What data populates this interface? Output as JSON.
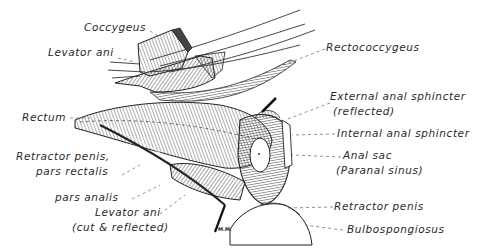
{
  "figure": {
    "signature": "M.M.",
    "labels": {
      "coccygeus": "Coccygeus",
      "levator_ani_top": "Levator ani",
      "rectum": "Rectum",
      "retractor_penis_rectalis_1": "Retractor penis,",
      "retractor_penis_rectalis_2": "pars rectalis",
      "pars_analis": "pars analis",
      "levator_ani_cut_1": "Levator ani",
      "levator_ani_cut_2": "(cut & reflected)",
      "rectococcygeus": "Rectococcygeus",
      "external_sphincter_1": "External anal sphincter",
      "external_sphincter_2": "(reflected)",
      "internal_sphincter": "Internal anal sphincter",
      "anal_sac_1": "Anal sac",
      "anal_sac_2": "(Paranal sinus)",
      "retractor_penis": "Retractor penis",
      "bulbospongiosus": "Bulbospongiosus"
    }
  }
}
